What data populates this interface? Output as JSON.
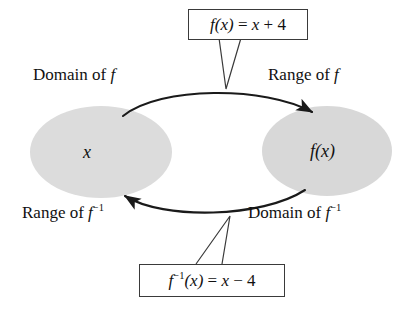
{
  "figure": {
    "background_color": "#ffffff",
    "ink_color": "#111111",
    "ellipse_fill_color": "#dcdcdc"
  },
  "sets": {
    "left": {
      "element_label": "x",
      "top_label": "Domain of f",
      "bottom_label": "Range of f⁻¹"
    },
    "right": {
      "element_label": "f(x)",
      "top_label": "Range of f",
      "bottom_label": "Domain of f⁻¹"
    }
  },
  "corner_labels": {
    "domain_of_f": {
      "prefix": "Domain of ",
      "symbol": "f",
      "exponent": ""
    },
    "range_of_f": {
      "prefix": "Range of ",
      "symbol": "f",
      "exponent": ""
    },
    "range_of_f_inverse": {
      "prefix": "Range of ",
      "symbol": "f",
      "exponent": "−1"
    },
    "domain_of_f_inverse": {
      "prefix": "Domain of ",
      "symbol": "f",
      "exponent": "−1"
    }
  },
  "callouts": {
    "forward": {
      "function_name": "f",
      "argument": "(x)",
      "equals": " = ",
      "expression_var": "x",
      "expression_op": " + 4",
      "full_text": "f(x) = x + 4",
      "points_to": "top-arrow"
    },
    "inverse": {
      "function_name": "f",
      "exponent": "−1",
      "argument": "(x)",
      "equals": " = ",
      "expression_var": "x",
      "expression_op": " − 4",
      "full_text": "f⁻¹(x) = x − 4",
      "points_to": "bottom-arrow"
    }
  },
  "arrows": {
    "top": {
      "direction": "left-to-right",
      "meaning": "f maps x to f(x)"
    },
    "bottom": {
      "direction": "right-to-left",
      "meaning": "f inverse maps f(x) back to x"
    }
  }
}
